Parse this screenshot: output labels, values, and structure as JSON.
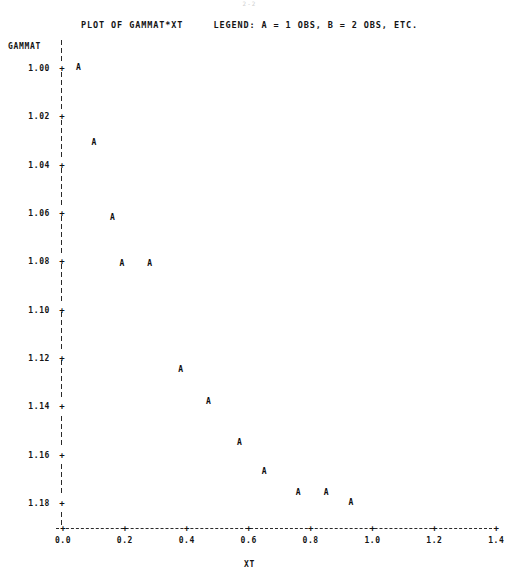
{
  "page": {
    "artifact_text": "2-2"
  },
  "title": {
    "text": "PLOT OF GAMMAT*XT     LEGEND: A = 1 OBS, B = 2 OBS, ETC.",
    "plot_of": "PLOT OF GAMMAT*XT",
    "legend": "LEGEND: A = 1 OBS, B = 2 OBS, ETC."
  },
  "axes": {
    "ylabel": "GAMMAT",
    "xlabel": "XT",
    "y_ticks": [
      "1.18",
      "1.16",
      "1.14",
      "1.12",
      "1.10",
      "1.08",
      "1.06",
      "1.04",
      "1.02",
      "1.00"
    ],
    "x_ticks": [
      "0.0",
      "0.2",
      "0.4",
      "0.6",
      "0.8",
      "1.0",
      "1.2",
      "1.4"
    ],
    "tick_glyph": "+"
  },
  "chart_data": {
    "type": "scatter",
    "title": "PLOT OF GAMMAT*XT",
    "subtitle": "LEGEND: A = 1 OBS, B = 2 OBS, ETC.",
    "xlabel": "XT",
    "ylabel": "GAMMAT",
    "xlim": [
      0.0,
      1.4
    ],
    "ylim": [
      1.0,
      1.18
    ],
    "xticks": [
      0.0,
      0.2,
      0.4,
      0.6,
      0.8,
      1.0,
      1.2,
      1.4
    ],
    "yticks": [
      1.0,
      1.02,
      1.04,
      1.06,
      1.08,
      1.1,
      1.12,
      1.14,
      1.16,
      1.18
    ],
    "grid": false,
    "legend": "A = 1 OBS, B = 2 OBS, ETC.",
    "marker": "A",
    "series": [
      {
        "name": "GAMMAT",
        "points": [
          {
            "x": 0.05,
            "y": 1.18,
            "label": "A"
          },
          {
            "x": 0.1,
            "y": 1.149,
            "label": "A"
          },
          {
            "x": 0.16,
            "y": 1.118,
            "label": "A"
          },
          {
            "x": 0.19,
            "y": 1.099,
            "label": "A"
          },
          {
            "x": 0.28,
            "y": 1.099,
            "label": "A"
          },
          {
            "x": 0.38,
            "y": 1.055,
            "label": "A"
          },
          {
            "x": 0.47,
            "y": 1.042,
            "label": "A"
          },
          {
            "x": 0.57,
            "y": 1.025,
            "label": "A"
          },
          {
            "x": 0.65,
            "y": 1.013,
            "label": "A"
          },
          {
            "x": 0.76,
            "y": 1.004,
            "label": "A"
          },
          {
            "x": 0.85,
            "y": 1.004,
            "label": "A"
          },
          {
            "x": 0.93,
            "y": 1.0,
            "label": "A"
          }
        ]
      }
    ]
  }
}
